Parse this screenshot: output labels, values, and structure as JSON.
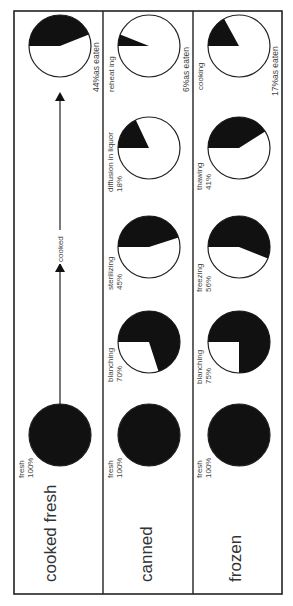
{
  "chart_data": {
    "type": "pie",
    "title": "",
    "orientation": "rotated-90-ccw",
    "rows": [
      {
        "name": "cooked fresh",
        "stages": [
          {
            "label": "fresh",
            "value": 100
          },
          {
            "label": "as eaten",
            "value": 44,
            "suffix": "as eaten"
          }
        ],
        "arrow_label": "cooked"
      },
      {
        "name": "canned",
        "stages": [
          {
            "label": "fresh",
            "value": 100
          },
          {
            "label": "blanching",
            "value": 70
          },
          {
            "label": "sterilizing",
            "value": 45
          },
          {
            "label": "diffusion in liquor",
            "value": 18
          },
          {
            "label": "reheating",
            "value": 6,
            "suffix": "as eaten"
          }
        ]
      },
      {
        "name": "frozen",
        "stages": [
          {
            "label": "fresh",
            "value": 100
          },
          {
            "label": "blanching",
            "value": 75
          },
          {
            "label": "freezing",
            "value": 56
          },
          {
            "label": "thawing",
            "value": 41
          },
          {
            "label": "cooking",
            "value": 17,
            "suffix": "as eaten"
          }
        ]
      }
    ],
    "colors": {
      "retained": "#111111",
      "lost": "#ffffff",
      "border": "#222222"
    }
  },
  "labels": {
    "row1": "cooked fresh",
    "row2": "canned",
    "row3": "frozen",
    "arrow": "cooked",
    "c1_fresh_a": "fresh",
    "c1_fresh_b": "100%",
    "c1_final": "44%as eaten",
    "c2_fresh_a": "fresh",
    "c2_fresh_b": "100%",
    "c2_blanch_a": "blanching",
    "c2_blanch_b": "70%",
    "c2_steril_a": "sterilizing",
    "c2_steril_b": "45%",
    "c2_diff_a": "diffusion in liquor",
    "c2_diff_b": "18%",
    "c2_reheat": "reheat ing",
    "c2_final": "6%as eaten",
    "c3_fresh_a": "fresh",
    "c3_fresh_b": "100%",
    "c3_blanch_a": "blanching",
    "c3_blanch_b": "75%",
    "c3_freez_a": "freezing",
    "c3_freez_b": "56%",
    "c3_thaw_a": "thawing",
    "c3_thaw_b": "41%",
    "c3_cook": "cooking",
    "c3_final": "17%as eaten"
  }
}
